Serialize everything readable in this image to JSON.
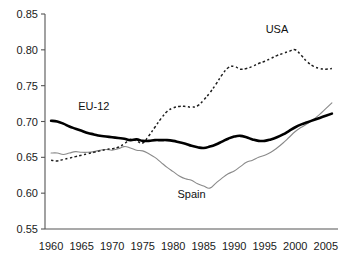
{
  "chart_data": {
    "type": "line",
    "title": "",
    "subtitle": "",
    "xlabel": "",
    "ylabel": "",
    "xlim": [
      1959,
      2007
    ],
    "ylim": [
      0.55,
      0.85
    ],
    "grid": false,
    "legend_position": "inline-annotations",
    "xticks": [
      1960,
      1965,
      1970,
      1975,
      1980,
      1985,
      1990,
      1995,
      2000,
      2005
    ],
    "xtick_labels": [
      "1960",
      "1965",
      "1970",
      "1975",
      "1980",
      "1985",
      "1990",
      "1995",
      "2000",
      "2005"
    ],
    "yticks": [
      0.55,
      0.6,
      0.65,
      0.7,
      0.75,
      0.8,
      0.85
    ],
    "ytick_labels": [
      "0.55",
      "0.60",
      "0.65",
      "0.70",
      "0.75",
      "0.80",
      "0.85"
    ],
    "x": [
      1960,
      1961,
      1962,
      1963,
      1964,
      1965,
      1966,
      1967,
      1968,
      1969,
      1970,
      1971,
      1972,
      1973,
      1974,
      1975,
      1976,
      1977,
      1978,
      1979,
      1980,
      1981,
      1982,
      1983,
      1984,
      1985,
      1986,
      1987,
      1988,
      1989,
      1990,
      1991,
      1992,
      1993,
      1994,
      1995,
      1996,
      1997,
      1998,
      1999,
      2000,
      2001,
      2002,
      2003,
      2004,
      2005,
      2006
    ],
    "series": [
      {
        "name": "EU-12",
        "color": "#000000",
        "style": "solid-thick",
        "label_x": 1967,
        "label_y": 0.716,
        "values": [
          0.701,
          0.7,
          0.697,
          0.693,
          0.69,
          0.687,
          0.684,
          0.682,
          0.68,
          0.679,
          0.678,
          0.677,
          0.676,
          0.674,
          0.675,
          0.673,
          0.673,
          0.674,
          0.674,
          0.674,
          0.673,
          0.671,
          0.669,
          0.666,
          0.664,
          0.663,
          0.665,
          0.668,
          0.672,
          0.676,
          0.679,
          0.68,
          0.678,
          0.675,
          0.673,
          0.673,
          0.675,
          0.678,
          0.682,
          0.687,
          0.692,
          0.696,
          0.699,
          0.702,
          0.705,
          0.708,
          0.711
        ]
      },
      {
        "name": "Spain",
        "color": "#8a8a8a",
        "style": "solid-thin",
        "label_x": 1983,
        "label_y": 0.593,
        "values": [
          0.656,
          0.656,
          0.654,
          0.656,
          0.658,
          0.657,
          0.657,
          0.658,
          0.66,
          0.661,
          0.66,
          0.662,
          0.665,
          0.663,
          0.66,
          0.659,
          0.655,
          0.65,
          0.643,
          0.636,
          0.63,
          0.624,
          0.62,
          0.618,
          0.613,
          0.61,
          0.607,
          0.614,
          0.621,
          0.627,
          0.631,
          0.637,
          0.643,
          0.646,
          0.65,
          0.653,
          0.657,
          0.663,
          0.67,
          0.678,
          0.686,
          0.692,
          0.697,
          0.703,
          0.71,
          0.718,
          0.726
        ]
      },
      {
        "name": "USA",
        "color": "#1d1d1d",
        "style": "dashed",
        "label_x": 1997,
        "label_y": 0.823,
        "values": [
          0.646,
          0.645,
          0.647,
          0.649,
          0.651,
          0.653,
          0.655,
          0.657,
          0.659,
          0.661,
          0.662,
          0.664,
          0.669,
          0.675,
          0.673,
          0.67,
          0.68,
          0.692,
          0.704,
          0.714,
          0.719,
          0.721,
          0.721,
          0.72,
          0.722,
          0.73,
          0.74,
          0.752,
          0.765,
          0.775,
          0.777,
          0.773,
          0.774,
          0.777,
          0.781,
          0.784,
          0.788,
          0.792,
          0.795,
          0.798,
          0.8,
          0.792,
          0.783,
          0.777,
          0.774,
          0.773,
          0.774
        ]
      }
    ]
  },
  "annotations": {
    "usa_label": "USA",
    "eu_label": "EU-12",
    "spain_label": "Spain"
  }
}
